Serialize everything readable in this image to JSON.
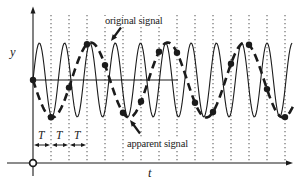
{
  "figure": {
    "background": "#ffffff",
    "ink_color": "#1b1b1b",
    "gridline_color": "#3c3c3c",
    "labels": {
      "original_signal": "original signal",
      "apparent_signal": "apparent signal",
      "y_axis": "y",
      "t_axis": "t",
      "sampling_interval": "T"
    }
  },
  "chart_data": {
    "type": "line",
    "xlabel": "t",
    "ylabel": "y",
    "legend_position": "inline-annotations",
    "grid": "vertical-dotted-at-sample-instants",
    "series": [
      {
        "name": "original signal",
        "style": "solid",
        "shape": "sine",
        "baseline_y": 80,
        "amplitude_px": 37,
        "period_px": 25.3,
        "phase_zero_x": 33,
        "sign": -1,
        "x_start": 33,
        "x_end": 292
      },
      {
        "name": "apparent signal",
        "style": "dashed",
        "shape": "sine",
        "baseline_y": 80,
        "amplitude_px": 37.5,
        "period_px": 77,
        "phase_zero_x": 33,
        "sign": 1,
        "x_start": 33,
        "x_end": 294
      }
    ],
    "samples": {
      "x_start": 33,
      "interval_px": 18,
      "count": 15,
      "marker": "filled-dot",
      "lies_on": "apparent signal"
    },
    "gridlines_x": [
      51,
      69,
      87,
      105,
      123,
      141,
      159,
      177,
      195,
      213,
      231,
      249,
      267,
      285
    ],
    "axes": {
      "y_axis_x": 33,
      "t_axis_y": 163,
      "mid_axis_y": 80,
      "mid_axis_x_end": 178
    },
    "interval_markers": {
      "label": "T",
      "count": 3,
      "y": 145
    }
  }
}
